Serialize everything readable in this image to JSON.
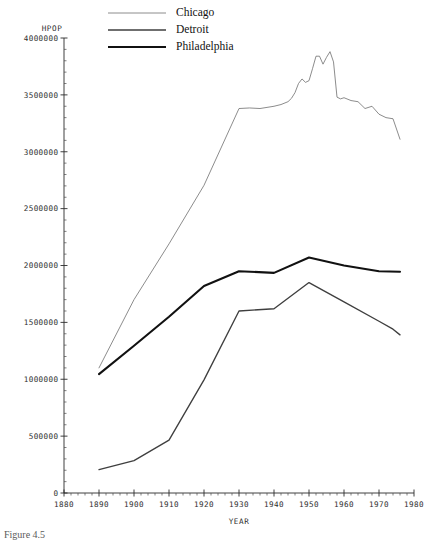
{
  "chart_data": {
    "type": "line",
    "title": "",
    "xlabel": "YEAR",
    "ylabel": "HPOP",
    "xlim": [
      1880,
      1980
    ],
    "ylim": [
      0,
      4000000
    ],
    "grid": false,
    "legend_position": "top-center",
    "x_ticks": [
      1880,
      1890,
      1900,
      1910,
      1920,
      1930,
      1940,
      1950,
      1960,
      1970,
      1980
    ],
    "x_tick_labels": [
      "1880",
      "1890",
      "1900",
      "1910",
      "1920",
      "1930",
      "1940",
      "1950",
      "1960",
      "1970",
      "1980"
    ],
    "x_minor_step": 2,
    "y_ticks": [
      0,
      500000,
      1000000,
      1500000,
      2000000,
      2500000,
      3000000,
      3500000,
      4000000
    ],
    "y_tick_labels": [
      "0",
      "500000",
      "1000000",
      "1500000",
      "2000000",
      "2500000",
      "3000000",
      "3500000",
      "4000000"
    ],
    "y_minor_step": 100000,
    "series": [
      {
        "name": "Chicago",
        "color": "#6e6e6e",
        "width": 0.8,
        "x": [
          1890,
          1900,
          1910,
          1920,
          1930,
          1933,
          1936,
          1940,
          1942,
          1944,
          1945,
          1946,
          1947,
          1948,
          1949,
          1950,
          1951,
          1952,
          1953,
          1954,
          1955,
          1956,
          1957,
          1958,
          1959,
          1960,
          1962,
          1964,
          1966,
          1968,
          1970,
          1972,
          1974,
          1976
        ],
        "y": [
          1100000,
          1700000,
          2190000,
          2705000,
          3380000,
          3385000,
          3380000,
          3400000,
          3415000,
          3440000,
          3470000,
          3520000,
          3600000,
          3640000,
          3610000,
          3625000,
          3730000,
          3840000,
          3840000,
          3770000,
          3830000,
          3880000,
          3790000,
          3480000,
          3465000,
          3475000,
          3450000,
          3440000,
          3380000,
          3400000,
          3330000,
          3300000,
          3290000,
          3110000
        ]
      },
      {
        "name": "Detroit",
        "color": "#3f3f3f",
        "width": 1.35,
        "x": [
          1890,
          1900,
          1910,
          1920,
          1930,
          1940,
          1950,
          1960,
          1970,
          1974,
          1976
        ],
        "y": [
          205000,
          285000,
          465000,
          995000,
          1600000,
          1620000,
          1850000,
          1680000,
          1510000,
          1440000,
          1390000
        ]
      },
      {
        "name": "Philadelphia",
        "color": "#111111",
        "width": 2.1,
        "x": [
          1890,
          1900,
          1910,
          1920,
          1930,
          1940,
          1950,
          1960,
          1970,
          1976
        ],
        "y": [
          1045000,
          1295000,
          1550000,
          1820000,
          1950000,
          1935000,
          2070000,
          2000000,
          1950000,
          1945000
        ]
      }
    ],
    "legend_entries": [
      {
        "label": "Chicago",
        "color": "#6e6e6e",
        "width": 0.8
      },
      {
        "label": "Detroit",
        "color": "#3f3f3f",
        "width": 1.35
      },
      {
        "label": "Philadelphia",
        "color": "#111111",
        "width": 2.1
      }
    ]
  },
  "caption": {
    "text": "Figure 4.5"
  }
}
